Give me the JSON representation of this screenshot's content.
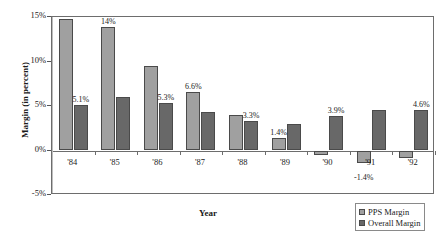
{
  "chart_data": {
    "type": "bar",
    "title": "",
    "xlabel": "Year",
    "ylabel": "Margin (in percent)",
    "categories": [
      "'84",
      "'85",
      "'86",
      "'87",
      "'88",
      "'89",
      "'90",
      "'91",
      "'92"
    ],
    "ylim": [
      -5,
      15
    ],
    "yticks": [
      15,
      10,
      5,
      0,
      -5
    ],
    "ytick_labels": [
      "15%",
      "10%",
      "5%",
      "0%",
      "-5%"
    ],
    "grid": false,
    "legend_position": "bottom-right",
    "series": [
      {
        "name": "PPS Margin",
        "color": "#a0a0a0",
        "values": [
          14.8,
          13.9,
          9.5,
          6.6,
          4.0,
          1.4,
          -0.5,
          -1.4,
          -0.8
        ],
        "labels": [
          "",
          "14%",
          "",
          "6.6%",
          "",
          "1.4%",
          "",
          "-1.4%",
          ""
        ]
      },
      {
        "name": "Overall Margin",
        "color": "#686868",
        "values": [
          5.1,
          6.0,
          5.3,
          4.3,
          3.3,
          3.0,
          3.9,
          4.5,
          4.6
        ],
        "labels": [
          "5.1%",
          "",
          "5.3%",
          "",
          "3.3%",
          "",
          "3.9%",
          "",
          "4.6%"
        ]
      }
    ]
  },
  "legend": {
    "items": [
      {
        "label": "PPS Margin",
        "swatch": "pps"
      },
      {
        "label": "Overall Margin",
        "swatch": "overall"
      }
    ]
  }
}
